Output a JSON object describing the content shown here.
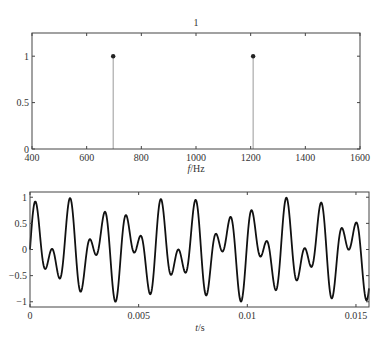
{
  "chart_data": [
    {
      "type": "stem",
      "title": "1",
      "xlabel": "f/Hz",
      "ylabel": "",
      "xlim": [
        400,
        1600
      ],
      "ylim": [
        0,
        1.25
      ],
      "xticks": [
        400,
        600,
        800,
        1000,
        1200,
        1400,
        1600
      ],
      "yticks": [
        0,
        0.5,
        1
      ],
      "xtick_labels": [
        "400",
        "600",
        "800",
        "1000",
        "1200",
        "1400",
        "1600"
      ],
      "ytick_labels": [
        "0",
        "0.5",
        "1"
      ],
      "x": [
        697,
        1209
      ],
      "values": [
        1,
        1
      ],
      "grid": false
    },
    {
      "type": "line",
      "title": "",
      "xlabel": "t/s",
      "ylabel": "",
      "xlim": [
        0,
        0.0156
      ],
      "ylim": [
        -1.1,
        1.1
      ],
      "xticks": [
        0,
        0.005,
        0.01,
        0.015
      ],
      "yticks": [
        -1,
        -0.5,
        0,
        0.5,
        1
      ],
      "xtick_labels": [
        "0",
        "0.005",
        "0.01",
        "0.015"
      ],
      "ytick_labels": [
        "−1",
        "−0.5",
        "0",
        "0.5",
        "1"
      ],
      "series": [
        {
          "name": "x(t) = 0.5 sin(2π·697t) + 0.5 sin(2π·1209t)",
          "components": [
            {
              "freq": 697,
              "amp": 0.5
            },
            {
              "freq": 1209,
              "amp": 0.5
            }
          ]
        }
      ],
      "grid": false
    }
  ],
  "labels": {
    "top_title": "1",
    "top_xlabel_italic": "f",
    "top_xlabel_unit": "/Hz",
    "bottom_xlabel_italic": "t",
    "bottom_xlabel_unit": "/s"
  }
}
